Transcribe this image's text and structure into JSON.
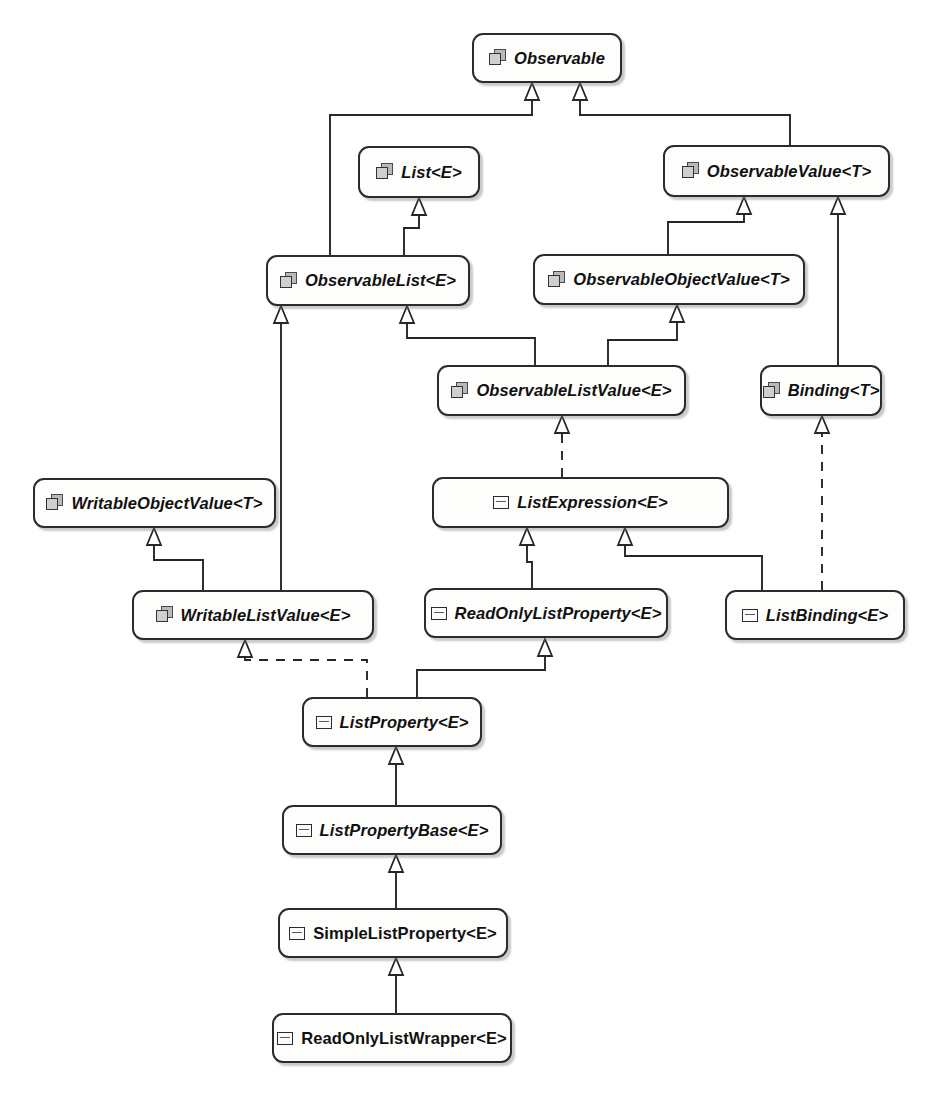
{
  "diagram": {
    "kind": "uml-class-diagram",
    "icon_names": {
      "interface": "interface-icon",
      "class": "class-icon"
    },
    "nodes": [
      {
        "id": "observable",
        "label": "Observable",
        "stereotype": "interface",
        "style": "abstract",
        "x": 472,
        "y": 33,
        "w": 150,
        "h": 50
      },
      {
        "id": "list",
        "label": "List<E>",
        "stereotype": "interface",
        "style": "abstract",
        "x": 358,
        "y": 146,
        "w": 122,
        "h": 52
      },
      {
        "id": "observablevalue",
        "label": "ObservableValue<T>",
        "stereotype": "interface",
        "style": "abstract",
        "x": 663,
        "y": 145,
        "w": 227,
        "h": 52
      },
      {
        "id": "observablelist",
        "label": "ObservableList<E>",
        "stereotype": "interface",
        "style": "abstract",
        "x": 266,
        "y": 255,
        "w": 204,
        "h": 51
      },
      {
        "id": "observableobjectvalue",
        "label": "ObservableObjectValue<T>",
        "stereotype": "interface",
        "style": "abstract",
        "x": 533,
        "y": 254,
        "w": 272,
        "h": 51
      },
      {
        "id": "observablelistvalue",
        "label": "ObservableListValue<E>",
        "stereotype": "interface",
        "style": "abstract",
        "x": 437,
        "y": 365,
        "w": 249,
        "h": 51
      },
      {
        "id": "binding",
        "label": "Binding<T>",
        "stereotype": "interface",
        "style": "abstract",
        "x": 760,
        "y": 365,
        "w": 122,
        "h": 51
      },
      {
        "id": "writableobjectvalue",
        "label": "WritableObjectValue<T>",
        "stereotype": "interface",
        "style": "abstract",
        "x": 33,
        "y": 478,
        "w": 243,
        "h": 50
      },
      {
        "id": "listexpression",
        "label": "ListExpression<E>",
        "stereotype": "class",
        "style": "abstract",
        "x": 432,
        "y": 477,
        "w": 297,
        "h": 51
      },
      {
        "id": "writablelistvalue",
        "label": "WritableListValue<E>",
        "stereotype": "interface",
        "style": "abstract",
        "x": 132,
        "y": 590,
        "w": 242,
        "h": 50
      },
      {
        "id": "readonlylistproperty",
        "label": "ReadOnlyListProperty<E>",
        "stereotype": "class",
        "style": "abstract",
        "x": 424,
        "y": 588,
        "w": 244,
        "h": 50
      },
      {
        "id": "listbinding",
        "label": "ListBinding<E>",
        "stereotype": "class",
        "style": "abstract",
        "x": 725,
        "y": 590,
        "w": 180,
        "h": 50
      },
      {
        "id": "listproperty",
        "label": "ListProperty<E>",
        "stereotype": "class",
        "style": "abstract",
        "x": 302,
        "y": 697,
        "w": 180,
        "h": 50
      },
      {
        "id": "listpropertybase",
        "label": "ListPropertyBase<E>",
        "stereotype": "class",
        "style": "abstract",
        "x": 282,
        "y": 805,
        "w": 220,
        "h": 50
      },
      {
        "id": "simplelistproperty",
        "label": "SimpleListProperty<E>",
        "stereotype": "class",
        "style": "concrete",
        "x": 278,
        "y": 908,
        "w": 230,
        "h": 50
      },
      {
        "id": "readonlylistwrapper",
        "label": "ReadOnlyListWrapper<E>",
        "stereotype": "class",
        "style": "concrete",
        "x": 272,
        "y": 1013,
        "w": 240,
        "h": 50
      }
    ],
    "edges": [
      {
        "from": "observablelist",
        "to": "observable",
        "kind": "inheritance"
      },
      {
        "from": "observablevalue",
        "to": "observable",
        "kind": "inheritance"
      },
      {
        "from": "observablelist",
        "to": "list",
        "kind": "inheritance"
      },
      {
        "from": "observableobjectvalue",
        "to": "observablevalue",
        "kind": "inheritance"
      },
      {
        "from": "binding",
        "to": "observablevalue",
        "kind": "inheritance"
      },
      {
        "from": "observablelistvalue",
        "to": "observablelist",
        "kind": "inheritance"
      },
      {
        "from": "observablelistvalue",
        "to": "observableobjectvalue",
        "kind": "inheritance"
      },
      {
        "from": "writablelistvalue",
        "to": "observablelist",
        "kind": "inheritance"
      },
      {
        "from": "writablelistvalue",
        "to": "writableobjectvalue",
        "kind": "inheritance"
      },
      {
        "from": "listexpression",
        "to": "observablelistvalue",
        "kind": "realization"
      },
      {
        "from": "listbinding",
        "to": "binding",
        "kind": "realization"
      },
      {
        "from": "readonlylistproperty",
        "to": "listexpression",
        "kind": "inheritance"
      },
      {
        "from": "listbinding",
        "to": "listexpression",
        "kind": "inheritance"
      },
      {
        "from": "listproperty",
        "to": "readonlylistproperty",
        "kind": "inheritance"
      },
      {
        "from": "listproperty",
        "to": "writablelistvalue",
        "kind": "realization"
      },
      {
        "from": "listpropertybase",
        "to": "listproperty",
        "kind": "inheritance"
      },
      {
        "from": "simplelistproperty",
        "to": "listpropertybase",
        "kind": "inheritance"
      },
      {
        "from": "readonlylistwrapper",
        "to": "simplelistproperty",
        "kind": "inheritance"
      }
    ]
  }
}
